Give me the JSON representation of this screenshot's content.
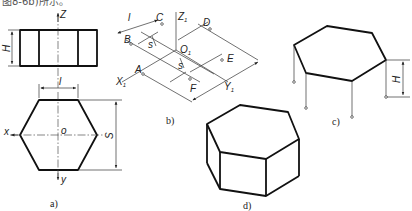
{
  "header_fragment": "图8-6b)所示。",
  "figures": {
    "a": {
      "caption": "a)",
      "labels": {
        "Z": "Z",
        "H": "H",
        "l": "l",
        "x": "x",
        "o": "o",
        "y": "y",
        "S": "S"
      }
    },
    "b": {
      "caption": "b)",
      "labels": {
        "l": "l",
        "C": "C",
        "Z1": "Z",
        "Z1_sub": "1",
        "D": "D",
        "B": "B",
        "O1": "O",
        "O1_sub": "1",
        "A": "A",
        "E": "E",
        "X1": "X",
        "X1_sub": "1",
        "F": "F",
        "Y1": "Y",
        "Y1_sub": "1",
        "s1": "s",
        "s2": "s"
      }
    },
    "c": {
      "caption": "c)",
      "labels": {
        "H": "H"
      }
    },
    "d": {
      "caption": "d)"
    }
  }
}
